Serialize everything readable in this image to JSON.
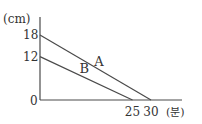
{
  "chart_data": {
    "type": "line",
    "title": "",
    "xlabel": "(분)",
    "ylabel": "(cm)",
    "origin_label": "0",
    "xlim": [
      0,
      40
    ],
    "ylim": [
      0,
      23
    ],
    "x_ticks": [
      {
        "value": 25,
        "label": "25"
      },
      {
        "value": 30,
        "label": "30"
      }
    ],
    "y_ticks": [
      {
        "value": 18,
        "label": "18"
      },
      {
        "value": 12,
        "label": "12"
      }
    ],
    "grid": false,
    "series": [
      {
        "name": "A",
        "label": "A",
        "points": [
          [
            0,
            18
          ],
          [
            30,
            0
          ]
        ]
      },
      {
        "name": "B",
        "label": "B",
        "points": [
          [
            0,
            12
          ],
          [
            25,
            0
          ]
        ]
      }
    ],
    "colors": {
      "line": "#4a4a4a",
      "text": "#333333"
    }
  }
}
